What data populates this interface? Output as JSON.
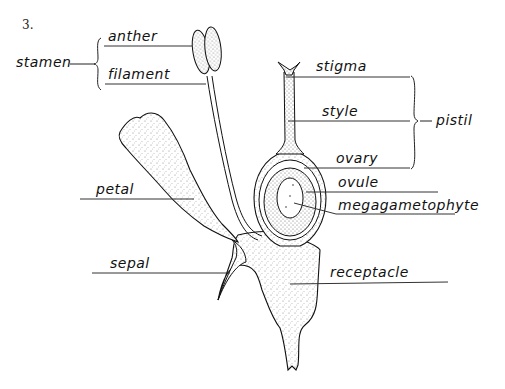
{
  "figure": {
    "number": "3."
  },
  "labels": {
    "stamen": "stamen",
    "anther": "anther",
    "filament": "filament",
    "stigma": "stigma",
    "style": "style",
    "pistil": "pistil",
    "ovary": "ovary",
    "ovule": "ovule",
    "megagametophyte": "megagametophyte",
    "petal": "petal",
    "sepal": "sepal",
    "receptacle": "receptacle"
  },
  "groups": {
    "stamen": [
      "anther",
      "filament"
    ],
    "pistil": [
      "stigma",
      "style",
      "ovary"
    ]
  },
  "colors": {
    "ink": "#111111",
    "stipple_fill": "#e4e4e4",
    "background": "#ffffff"
  }
}
